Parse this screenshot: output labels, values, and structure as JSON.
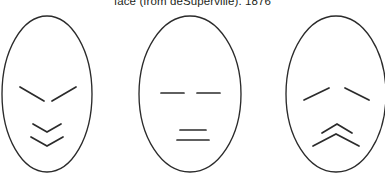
{
  "figure": {
    "caption": "face (from deSuperville). 1876",
    "stroke_color": "#2b2b2b",
    "background_color": "#ffffff",
    "faces": [
      {
        "id": "face-left",
        "expression_label": "angled brows, downward chevron mouth",
        "eyes": "angled-inward-down",
        "mouth": "double-downward-chevron"
      },
      {
        "id": "face-middle",
        "expression_label": "horizontal straight eyes, two horizontal mouth lines",
        "eyes": "horizontal-straight",
        "mouth": "double-horizontal-line"
      },
      {
        "id": "face-right",
        "expression_label": "raised outer brows, upward chevron mouth",
        "eyes": "angled-outward-up",
        "mouth": "double-upward-chevron"
      }
    ]
  }
}
